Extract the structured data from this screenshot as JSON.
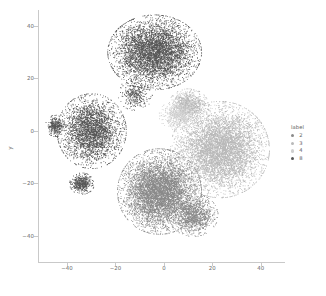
{
  "chart_data": {
    "type": "scatter",
    "title": "",
    "xlabel": "",
    "ylabel": "y",
    "xlim": [
      -52,
      50
    ],
    "ylim": [
      -50,
      46
    ],
    "grid": false,
    "xticks": [
      -40,
      -20,
      0,
      20,
      40
    ],
    "xtick_labels": [
      "−40",
      "−20",
      "0",
      "20",
      "40"
    ],
    "yticks": [
      -40,
      -20,
      0,
      20,
      40
    ],
    "ytick_labels": [
      "−40",
      "−20",
      "0",
      "20",
      "40"
    ],
    "legend": {
      "title": "label",
      "position": "right",
      "entries": [
        {
          "label": "2",
          "color": "#8a8a8a"
        },
        {
          "label": "3",
          "color": "#b9b9b9"
        },
        {
          "label": "4",
          "color": "#cfcfcf"
        },
        {
          "label": "8",
          "color": "#585858"
        }
      ]
    },
    "series": [
      {
        "name": "8",
        "label": "8",
        "color": "#585858",
        "point_count": 9000,
        "clusters": [
          {
            "cx": -4,
            "cy": 30,
            "rx": 19,
            "ry": 14,
            "weight": 0.52
          },
          {
            "cx": -30,
            "cy": 0,
            "rx": 14,
            "ry": 14,
            "weight": 0.34
          },
          {
            "cx": -34,
            "cy": -20,
            "rx": 5,
            "ry": 4,
            "weight": 0.06
          },
          {
            "cx": -45,
            "cy": 2,
            "rx": 4,
            "ry": 4,
            "weight": 0.04
          },
          {
            "cx": -12,
            "cy": 14,
            "rx": 7,
            "ry": 6,
            "weight": 0.04
          }
        ]
      },
      {
        "name": "3",
        "label": "3",
        "color": "#b9b9b9",
        "point_count": 7000,
        "clusters": [
          {
            "cx": 23,
            "cy": -7,
            "rx": 20,
            "ry": 18,
            "weight": 0.88
          },
          {
            "cx": 10,
            "cy": 10,
            "rx": 8,
            "ry": 6,
            "weight": 0.12
          }
        ]
      },
      {
        "name": "2",
        "label": "2",
        "color": "#8a8a8a",
        "point_count": 7000,
        "clusters": [
          {
            "cx": -2,
            "cy": -23,
            "rx": 17,
            "ry": 16,
            "weight": 0.82
          },
          {
            "cx": 12,
            "cy": -32,
            "rx": 10,
            "ry": 8,
            "weight": 0.18
          }
        ]
      },
      {
        "name": "4",
        "label": "4",
        "color": "#cfcfcf",
        "point_count": 600,
        "clusters": [
          {
            "cx": 6,
            "cy": 6,
            "rx": 8,
            "ry": 6,
            "weight": 1.0
          }
        ]
      }
    ]
  }
}
